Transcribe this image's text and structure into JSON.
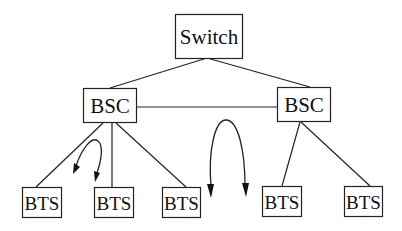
{
  "diagram": {
    "type": "network-hierarchy",
    "nodes": [
      {
        "id": "switch",
        "label": "Switch",
        "level": 0
      },
      {
        "id": "bsc-left",
        "label": "BSC",
        "level": 1
      },
      {
        "id": "bsc-right",
        "label": "BSC",
        "level": 1
      },
      {
        "id": "bts-1",
        "label": "BTS",
        "level": 2
      },
      {
        "id": "bts-2",
        "label": "BTS",
        "level": 2
      },
      {
        "id": "bts-3",
        "label": "BTS",
        "level": 2
      },
      {
        "id": "bts-4",
        "label": "BTS",
        "level": 2
      },
      {
        "id": "bts-5",
        "label": "BTS",
        "level": 2
      }
    ],
    "edges": [
      {
        "from": "switch",
        "to": "bsc-left"
      },
      {
        "from": "switch",
        "to": "bsc-right"
      },
      {
        "from": "bsc-left",
        "to": "bsc-right"
      },
      {
        "from": "bsc-left",
        "to": "bts-1"
      },
      {
        "from": "bsc-left",
        "to": "bts-2"
      },
      {
        "from": "bsc-left",
        "to": "bts-3"
      },
      {
        "from": "bsc-right",
        "to": "bts-4"
      },
      {
        "from": "bsc-right",
        "to": "bts-5"
      }
    ],
    "handoffs": [
      {
        "id": "intra-bsc-handoff",
        "between": [
          "bts-1",
          "bts-2"
        ],
        "direction": "bidirectional"
      },
      {
        "id": "inter-bsc-handoff",
        "between": [
          "bts-3",
          "bts-4"
        ],
        "direction": "bidirectional"
      }
    ]
  }
}
